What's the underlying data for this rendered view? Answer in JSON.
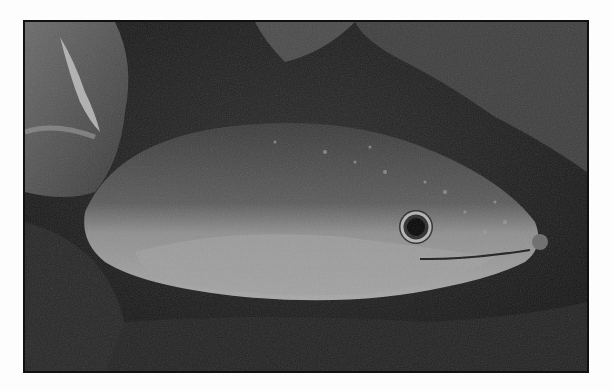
{
  "image": {
    "subject": "Eel resting among rocks underwater",
    "style": "grayscale photograph with black border",
    "colors": {
      "background": "#fdfdfd",
      "border": "#111111",
      "water": "#1c1c1c",
      "eel_back": "#555555",
      "eel_belly": "#9a9a9a",
      "rock": "#4a4a4a",
      "eye_ring": "#bbbbbb",
      "pupil": "#050505"
    }
  }
}
